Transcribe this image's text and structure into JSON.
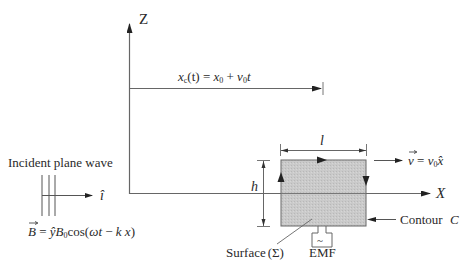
{
  "diagram": {
    "axes": {
      "z_label": "Z",
      "x_label": "X"
    },
    "position_label": {
      "lhs": "x",
      "lhs_sub": "c",
      "arg": "(t)",
      "eq": " = ",
      "x0": "x",
      "x0_sub": "0",
      "plus": " + ",
      "v0": "v",
      "v0_sub": "0",
      "t": "t"
    },
    "incident_wave": {
      "title": "Incident plane wave",
      "direction_label": "î",
      "field_eq": {
        "B": "B",
        "eq": " = ",
        "yhat": "ŷ",
        "B0": "B",
        "B0_sub": "0",
        "cos": "cos(",
        "omega_t": "ωt",
        "minus": " − ",
        "kx": "k x",
        "close": ")"
      }
    },
    "loop": {
      "width_label": "l",
      "height_label": "h",
      "velocity": {
        "v": "v",
        "eq": " = ",
        "v0": "v",
        "v0_sub": "0",
        "xhat": "x̂"
      },
      "contour_label": "Contour",
      "contour_symbol": "C",
      "surface_label": "Surface",
      "surface_symbol": "(Σ)",
      "emf_label": "EMF",
      "emf_symbol": "~"
    },
    "colors": {
      "line": "#555555",
      "text": "#2a2a2a",
      "fill": "#c8c8c8"
    }
  }
}
